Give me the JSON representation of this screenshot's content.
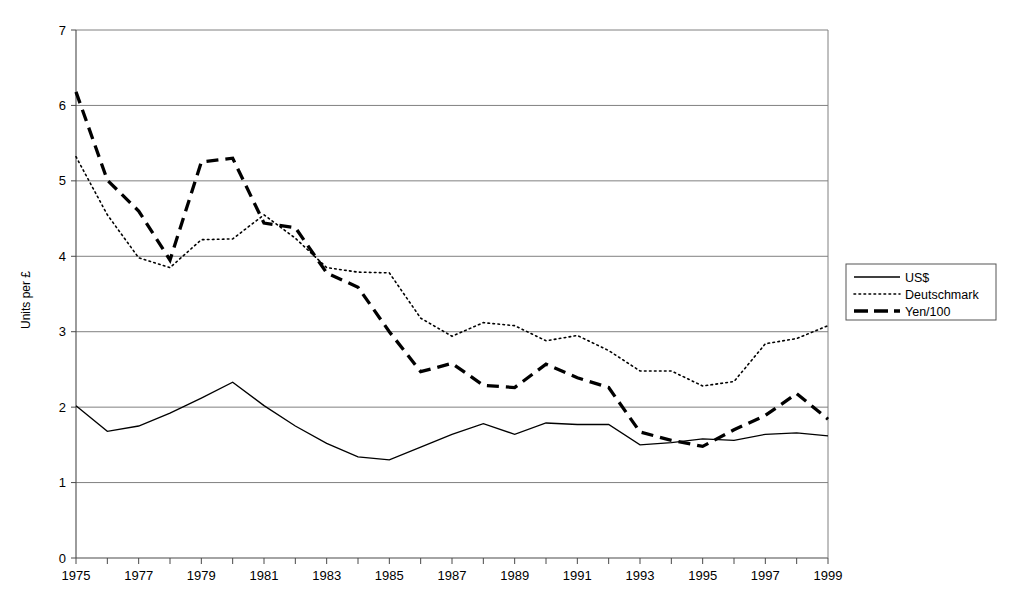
{
  "chart_data": {
    "type": "line",
    "title": "",
    "subtitle": "",
    "xlabel": "",
    "ylabel": "Units per £",
    "xlim": [
      1975,
      1999
    ],
    "ylim": [
      0,
      7
    ],
    "ytick_step": 1,
    "xtick_step": 1,
    "xtick_label_step": 2,
    "grid": true,
    "legend_position": "right",
    "x": [
      1975,
      1976,
      1977,
      1978,
      1979,
      1980,
      1981,
      1982,
      1983,
      1984,
      1985,
      1986,
      1987,
      1988,
      1989,
      1990,
      1991,
      1992,
      1993,
      1994,
      1995,
      1996,
      1997,
      1998,
      1999
    ],
    "xticklabels": [
      "1975",
      "",
      "1977",
      "",
      "1979",
      "",
      "1981",
      "",
      "1983",
      "",
      "1985",
      "",
      "1987",
      "",
      "1989",
      "",
      "1991",
      "",
      "1993",
      "",
      "1995",
      "",
      "1997",
      "",
      "1999"
    ],
    "yticklabels": [
      "0",
      "1",
      "2",
      "3",
      "4",
      "5",
      "6",
      "7"
    ],
    "series": [
      {
        "name": "US$",
        "style": "solid",
        "values": [
          2.02,
          1.68,
          1.75,
          1.92,
          2.12,
          2.33,
          2.02,
          1.75,
          1.52,
          1.34,
          1.3,
          1.47,
          1.64,
          1.78,
          1.64,
          1.79,
          1.77,
          1.77,
          1.5,
          1.53,
          1.58,
          1.56,
          1.64,
          1.66,
          1.62
        ]
      },
      {
        "name": "Deutschmark",
        "style": "dotted",
        "values": [
          5.32,
          4.55,
          3.98,
          3.85,
          4.22,
          4.23,
          4.55,
          4.24,
          3.85,
          3.79,
          3.78,
          3.18,
          2.94,
          3.12,
          3.08,
          2.88,
          2.95,
          2.75,
          2.48,
          2.48,
          2.28,
          2.34,
          2.84,
          2.91,
          3.08
        ]
      },
      {
        "name": "Yen/100",
        "style": "dashed",
        "values": [
          6.18,
          5.01,
          4.6,
          3.95,
          5.25,
          5.3,
          4.44,
          4.38,
          3.78,
          3.59,
          3.0,
          2.47,
          2.58,
          2.29,
          2.26,
          2.57,
          2.39,
          2.26,
          1.67,
          1.56,
          1.48,
          1.7,
          1.89,
          2.18,
          1.84
        ]
      }
    ],
    "legend": [
      {
        "label": "US$",
        "style": "solid"
      },
      {
        "label": "Deutschmark",
        "style": "dotted"
      },
      {
        "label": "Yen/100",
        "style": "dashed"
      }
    ]
  }
}
